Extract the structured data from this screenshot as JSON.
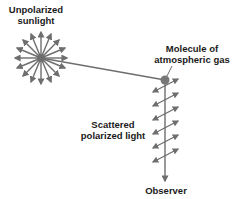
{
  "labels": {
    "sunlight": [
      "Unpolarized",
      "sunlight"
    ],
    "molecule": [
      "Molecule of",
      "atmospheric gas"
    ],
    "scattered": [
      "Scattered",
      "polarized light"
    ],
    "observer": "Observer"
  },
  "colors": {
    "arrow": "#6e6e6e",
    "text": "#1a1a1a",
    "molecule": "#777777"
  },
  "geometry": {
    "sun_center": [
      41,
      58
    ],
    "molecule_center": [
      165,
      80
    ],
    "observer_arrow_end": [
      165,
      182
    ],
    "scatter_arrow_count": 6
  }
}
